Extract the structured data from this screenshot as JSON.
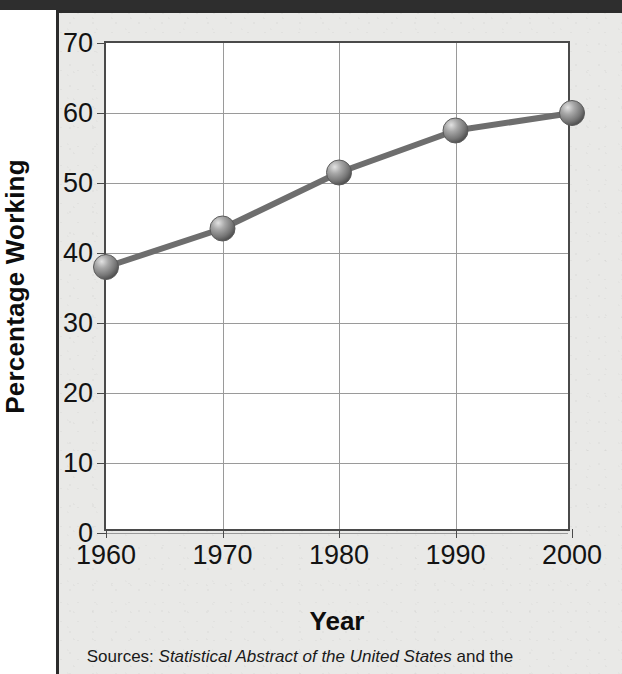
{
  "figure": {
    "background_color": "#e9e9e7",
    "plot_background_color": "#ffffff",
    "line_color": "#6e6e6e",
    "marker_color": "#8a8a8a",
    "grid_color": "#9a9a9a",
    "axis_color": "#4a4a4a",
    "text_color": "#131313"
  },
  "source_note": {
    "prefix": "Sources: ",
    "italic_title": "Statistical Abstract of the United States",
    "suffix": " and the"
  },
  "chart_data": {
    "type": "line",
    "title": "",
    "xlabel": "Year",
    "ylabel": "Percentage Working",
    "x": [
      1960,
      1970,
      1980,
      1990,
      2000
    ],
    "values": [
      38,
      43.5,
      51.5,
      57.5,
      60
    ],
    "xtick_labels": [
      "1960",
      "1970",
      "1980",
      "1990",
      "2000"
    ],
    "ytick_labels": [
      "0",
      "10",
      "20",
      "30",
      "40",
      "50",
      "60",
      "70"
    ],
    "yticks": [
      0,
      10,
      20,
      30,
      40,
      50,
      60,
      70
    ],
    "ylim": [
      0,
      70
    ],
    "xlim": [
      1960,
      2000
    ],
    "grid": true,
    "legend": "none",
    "marker": "sphere"
  }
}
